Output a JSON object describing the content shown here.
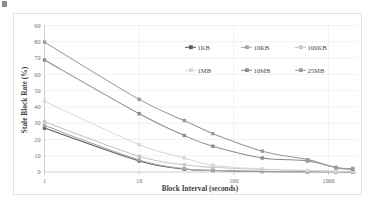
{
  "chart_data": {
    "type": "line",
    "title": "",
    "xlabel": "Block Interval (seconds)",
    "ylabel": "Stale Block Rate (%)",
    "xscale": "log",
    "xlim": [
      1,
      2000
    ],
    "ylim": [
      0,
      90
    ],
    "ytick_labels": [
      "0",
      "10",
      "20",
      "30",
      "40",
      "50",
      "60",
      "70",
      "80",
      "90"
    ],
    "ytick_values": [
      0,
      10,
      20,
      30,
      40,
      50,
      60,
      70,
      80,
      90
    ],
    "xtick_labels": [
      "1",
      "10",
      "100",
      "1000"
    ],
    "xtick_values": [
      1,
      10,
      100,
      1000
    ],
    "grid": "horizontal-and-vertical",
    "legend_position": "inside-upper-right",
    "x": [
      1,
      10,
      30,
      60,
      200,
      600,
      1200,
      1800
    ],
    "series": [
      {
        "name": "1KB",
        "color": "#5b5b5b",
        "marker": "square",
        "values": [
          27.0,
          6.8,
          1.8,
          0.9,
          0.3,
          0.1,
          0.1,
          0.0
        ]
      },
      {
        "name": "10KB",
        "color": "#a8a8a8",
        "marker": "square",
        "values": [
          28.5,
          7.4,
          2.0,
          1.0,
          0.4,
          0.2,
          0.1,
          0.1
        ]
      },
      {
        "name": "100KB",
        "color": "#c6c6c6",
        "marker": "square",
        "values": [
          30.8,
          9.6,
          4.4,
          2.9,
          1.6,
          0.8,
          0.4,
          0.3
        ]
      },
      {
        "name": "1MB",
        "color": "#d8d8d8",
        "marker": "square",
        "values": [
          43.4,
          16.8,
          8.6,
          4.2,
          1.9,
          1.0,
          0.5,
          0.4
        ]
      },
      {
        "name": "10MB",
        "color": "#8c8c8c",
        "marker": "square",
        "values": [
          68.8,
          35.8,
          22.4,
          15.8,
          8.6,
          6.8,
          2.6,
          1.6
        ]
      },
      {
        "name": "25MB",
        "color": "#9a9a9a",
        "marker": "square",
        "values": [
          79.8,
          44.6,
          31.6,
          23.6,
          12.8,
          7.6,
          2.8,
          2.2
        ]
      }
    ]
  },
  "legend": {
    "rows": [
      [
        "1KB",
        "10KB",
        "100KB"
      ],
      [
        "1MB",
        "10MB",
        "25MB"
      ]
    ]
  }
}
